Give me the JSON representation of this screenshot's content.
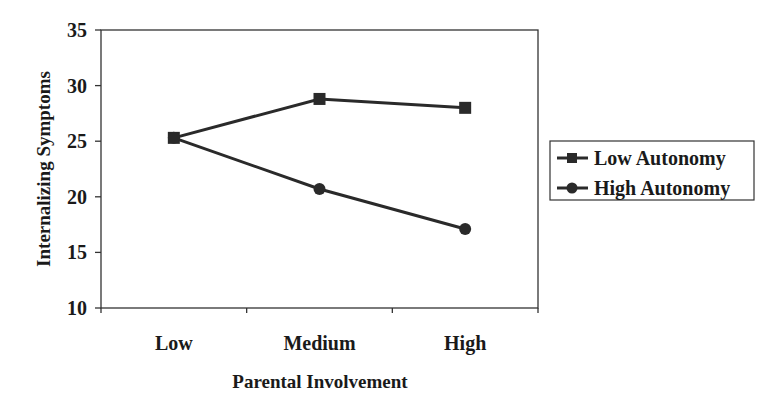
{
  "chart_data": {
    "type": "line",
    "title": "",
    "xlabel": "Parental Involvement",
    "ylabel": "Internalizing Symptoms",
    "categories": [
      "Low",
      "Medium",
      "High"
    ],
    "ylim": [
      10,
      35
    ],
    "yticks": [
      10,
      15,
      20,
      25,
      30,
      35
    ],
    "grid": false,
    "legend_position": "right",
    "series": [
      {
        "name": "Low Autonomy",
        "marker": "square",
        "values": [
          25.3,
          28.8,
          28.0
        ]
      },
      {
        "name": "High Autonomy",
        "marker": "circle",
        "values": [
          25.3,
          20.7,
          17.1
        ]
      }
    ]
  },
  "colors": {
    "line": "#2a2a2a",
    "frame": "#333333",
    "background": "#ffffff"
  }
}
